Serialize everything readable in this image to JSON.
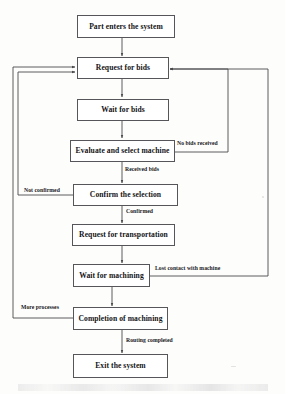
{
  "diagram": {
    "type": "flowchart",
    "nodes": [
      {
        "id": "start",
        "label": "Part enters the system"
      },
      {
        "id": "request_bids",
        "label": "Request for bids"
      },
      {
        "id": "wait_bids",
        "label": "Wait for bids"
      },
      {
        "id": "evaluate",
        "label": "Evaluate and select machine"
      },
      {
        "id": "confirm",
        "label": "Confirm the selection"
      },
      {
        "id": "transport",
        "label": "Request for transportation"
      },
      {
        "id": "wait_mach",
        "label": "Wait for machining"
      },
      {
        "id": "completion",
        "label": "Completion of machining"
      },
      {
        "id": "exit",
        "label": "Exit the system"
      }
    ],
    "edge_labels": [
      {
        "id": "no_bids",
        "label": "No bids received"
      },
      {
        "id": "received_bids",
        "label": "Received bids"
      },
      {
        "id": "not_confirmed",
        "label": "Not confirmed"
      },
      {
        "id": "confirmed",
        "label": "Confirmed"
      },
      {
        "id": "lost_contact",
        "label": "Lost contact with machine"
      },
      {
        "id": "more_proc",
        "label": "More processes"
      },
      {
        "id": "routing_done",
        "label": "Routing completed"
      }
    ],
    "colors": {
      "box_border": "#56565a",
      "box_fill": "#ffffff",
      "connector": "#4a4a4e",
      "text": "#131316",
      "page": "#fdfdfc"
    }
  }
}
